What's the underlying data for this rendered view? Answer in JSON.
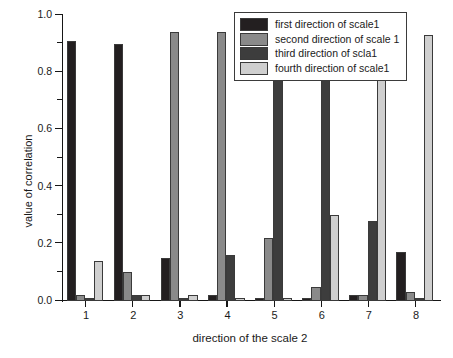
{
  "chart_data": {
    "type": "bar",
    "title": "",
    "xlabel": "direction of the scale 2",
    "ylabel": "value of correlation",
    "categories": [
      "1",
      "2",
      "3",
      "4",
      "5",
      "6",
      "7",
      "8"
    ],
    "ylim": [
      0.0,
      1.0
    ],
    "ytick_labels": [
      "0.0",
      "0.2",
      "0.4",
      "0.6",
      "0.8",
      "1.0"
    ],
    "ytick_values": [
      0.0,
      0.2,
      0.4,
      0.6,
      0.8,
      1.0
    ],
    "grid": false,
    "legend_position": "top-right",
    "series": [
      {
        "name": "first direction of scale1",
        "color": "#231f20",
        "values": [
          0.91,
          0.9,
          0.15,
          0.02,
          0.01,
          0.01,
          0.02,
          0.17
        ]
      },
      {
        "name": "second direction of scale 1",
        "color": "#8a8a8a",
        "values": [
          0.02,
          0.1,
          0.94,
          0.94,
          0.22,
          0.05,
          0.02,
          0.03
        ]
      },
      {
        "name": "third direction of scla1",
        "color": "#3d3d3d",
        "values": [
          0.01,
          0.02,
          0.01,
          0.16,
          0.94,
          0.95,
          0.28,
          0.01
        ]
      },
      {
        "name": "fourth direction of scale1",
        "color": "#cfcfcf",
        "values": [
          0.14,
          0.02,
          0.02,
          0.01,
          0.01,
          0.3,
          0.99,
          0.93
        ]
      }
    ]
  },
  "axes": {
    "y_label": "value of correlation",
    "x_label": "direction of the scale 2"
  },
  "legend": {
    "items": [
      {
        "label": "first direction of scale1",
        "color": "#231f20"
      },
      {
        "label": "second direction of scale 1",
        "color": "#8a8a8a"
      },
      {
        "label": "third direction of scla1",
        "color": "#3d3d3d"
      },
      {
        "label": "fourth direction of scale1",
        "color": "#cfcfcf"
      }
    ]
  }
}
